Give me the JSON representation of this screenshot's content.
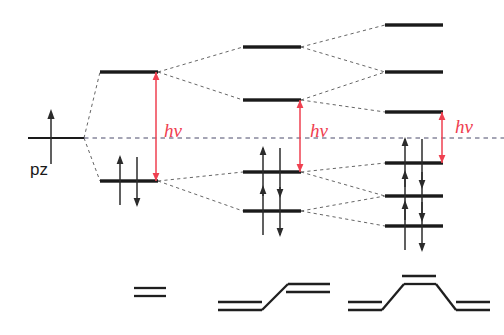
{
  "figure": {
    "background_color": "#ffffff",
    "accent_color": "#ef4050",
    "level_color": "#1a1a1a",
    "correlation_color": "#555555"
  },
  "atomic_orbital": {
    "label": "pz",
    "level_x1": 28,
    "level_x2": 84,
    "level_y": 138,
    "electron_arrow": "up",
    "label_x": 30,
    "label_y": 175
  },
  "midline": {
    "y": 138,
    "x1": 84,
    "x2": 504,
    "style": "dashed"
  },
  "photon_labels": [
    {
      "id": "hv-ethene",
      "text": "hν",
      "x": 164,
      "y": 137
    },
    {
      "id": "hv-butadiene",
      "text": "hν",
      "x": 310,
      "y": 137
    },
    {
      "id": "hv-hexatriene",
      "text": "hν",
      "x": 455,
      "y": 133
    }
  ],
  "photon_arrows": [
    {
      "id": "hv-arrow-ethene",
      "x": 156,
      "y_top": 72,
      "y_bottom": 181
    },
    {
      "id": "hv-arrow-butadiene",
      "x": 300,
      "y_top": 100,
      "y_bottom": 172
    },
    {
      "id": "hv-arrow-hexatriene",
      "x": 442,
      "y_top": 112,
      "y_bottom": 163
    }
  ],
  "groups": [
    {
      "id": "ethene",
      "name": "ethene",
      "bar_x1": 100,
      "bar_x2": 158,
      "levels": [
        {
          "id": "ethene-pi-star",
          "y": 72,
          "electrons": 0,
          "label": "pi*"
        },
        {
          "id": "ethene-pi",
          "y": 181,
          "electrons": 2,
          "label": "pi"
        }
      ]
    },
    {
      "id": "butadiene",
      "name": "butadiene",
      "bar_x1": 243,
      "bar_x2": 301,
      "levels": [
        {
          "id": "butadiene-psi4",
          "y": 47,
          "electrons": 0,
          "label": "psi4"
        },
        {
          "id": "butadiene-psi3",
          "y": 100,
          "electrons": 0,
          "label": "psi3"
        },
        {
          "id": "butadiene-psi2",
          "y": 172,
          "electrons": 2,
          "label": "psi2"
        },
        {
          "id": "butadiene-psi1",
          "y": 211,
          "electrons": 2,
          "label": "psi1"
        }
      ]
    },
    {
      "id": "hexatriene",
      "name": "hexatriene",
      "bar_x1": 385,
      "bar_x2": 443,
      "levels": [
        {
          "id": "hexatriene-psi6",
          "y": 25,
          "electrons": 0,
          "label": "psi6"
        },
        {
          "id": "hexatriene-psi5",
          "y": 72,
          "electrons": 0,
          "label": "psi5"
        },
        {
          "id": "hexatriene-psi4",
          "y": 112,
          "electrons": 0,
          "label": "psi4"
        },
        {
          "id": "hexatriene-psi3",
          "y": 163,
          "electrons": 2,
          "label": "psi3"
        },
        {
          "id": "hexatriene-psi2",
          "y": 196,
          "electrons": 2,
          "label": "psi2"
        },
        {
          "id": "hexatriene-psi1",
          "y": 226,
          "electrons": 2,
          "label": "psi1"
        }
      ]
    }
  ],
  "molecules": [
    {
      "id": "molecule-ethene",
      "name": "ethene",
      "double_bonds": 1,
      "lines": [
        {
          "x1": 134,
          "y1": 288,
          "x2": 166,
          "y2": 288
        },
        {
          "x1": 134,
          "y1": 296,
          "x2": 166,
          "y2": 296
        }
      ]
    },
    {
      "id": "molecule-butadiene",
      "name": "butadiene",
      "double_bonds": 2,
      "lines": [
        {
          "x1": 218,
          "y1": 310,
          "x2": 262,
          "y2": 310
        },
        {
          "x1": 218,
          "y1": 302,
          "x2": 262,
          "y2": 302
        },
        {
          "x1": 262,
          "y1": 310,
          "x2": 288,
          "y2": 284
        },
        {
          "x1": 288,
          "y1": 284,
          "x2": 330,
          "y2": 284
        },
        {
          "x1": 286,
          "y1": 292,
          "x2": 330,
          "y2": 292
        }
      ]
    },
    {
      "id": "molecule-hexatriene",
      "name": "hexatriene",
      "double_bonds": 3,
      "lines": [
        {
          "x1": 348,
          "y1": 310,
          "x2": 382,
          "y2": 310
        },
        {
          "x1": 348,
          "y1": 302,
          "x2": 382,
          "y2": 302
        },
        {
          "x1": 382,
          "y1": 310,
          "x2": 404,
          "y2": 284
        },
        {
          "x1": 404,
          "y1": 284,
          "x2": 436,
          "y2": 284
        },
        {
          "x1": 402,
          "y1": 276,
          "x2": 436,
          "y2": 276
        },
        {
          "x1": 436,
          "y1": 284,
          "x2": 456,
          "y2": 310
        },
        {
          "x1": 456,
          "y1": 310,
          "x2": 490,
          "y2": 310
        },
        {
          "x1": 456,
          "y1": 302,
          "x2": 490,
          "y2": 302
        }
      ]
    }
  ],
  "correlations": [
    {
      "from_x": 84,
      "from_y": 138,
      "to_x": 100,
      "to_y": 72
    },
    {
      "from_x": 84,
      "from_y": 138,
      "to_x": 100,
      "to_y": 181
    },
    {
      "from_x": 158,
      "from_y": 72,
      "to_x": 243,
      "to_y": 47
    },
    {
      "from_x": 158,
      "from_y": 72,
      "to_x": 243,
      "to_y": 100
    },
    {
      "from_x": 158,
      "from_y": 181,
      "to_x": 243,
      "to_y": 172
    },
    {
      "from_x": 158,
      "from_y": 181,
      "to_x": 243,
      "to_y": 211
    },
    {
      "from_x": 301,
      "from_y": 47,
      "to_x": 385,
      "to_y": 25
    },
    {
      "from_x": 301,
      "from_y": 47,
      "to_x": 385,
      "to_y": 72
    },
    {
      "from_x": 301,
      "from_y": 100,
      "to_x": 385,
      "to_y": 72
    },
    {
      "from_x": 301,
      "from_y": 100,
      "to_x": 385,
      "to_y": 112
    },
    {
      "from_x": 301,
      "from_y": 172,
      "to_x": 385,
      "to_y": 163
    },
    {
      "from_x": 301,
      "from_y": 172,
      "to_x": 385,
      "to_y": 196
    },
    {
      "from_x": 301,
      "from_y": 211,
      "to_x": 385,
      "to_y": 196
    },
    {
      "from_x": 301,
      "from_y": 211,
      "to_x": 385,
      "to_y": 226
    }
  ]
}
